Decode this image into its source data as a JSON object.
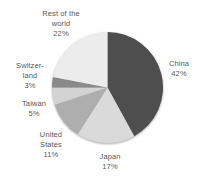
{
  "chart_data": {
    "type": "pie",
    "title": "",
    "categories": [
      "China",
      "Japan",
      "United States",
      "Taiwan",
      "Switzerland",
      "Rest of the world"
    ],
    "values": [
      42,
      17,
      11,
      5,
      3,
      22
    ],
    "unit": "%",
    "colors": [
      "#4e4e4e",
      "#dadada",
      "#aeaeae",
      "#d3d3d3",
      "#8a8a8a",
      "#ececec"
    ],
    "start_angle_deg": 0,
    "direction": "clockwise",
    "legend": "none",
    "label_placement": "outside",
    "text_color": "#595959",
    "labels": [
      {
        "name": "rest-of-world",
        "lines": [
          "Rest of the",
          "world",
          "22%"
        ]
      },
      {
        "name": "china",
        "lines": [
          "China",
          "42%"
        ]
      },
      {
        "name": "switzerland",
        "lines": [
          "Switzer-",
          "land",
          "3%"
        ]
      },
      {
        "name": "taiwan",
        "lines": [
          "Taiwan",
          "5%"
        ]
      },
      {
        "name": "united-states",
        "lines": [
          "United",
          "States",
          "11%"
        ]
      },
      {
        "name": "japan",
        "lines": [
          "Japan",
          "17%"
        ]
      }
    ]
  }
}
